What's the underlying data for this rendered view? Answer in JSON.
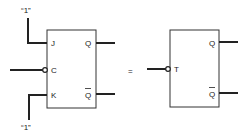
{
  "diagram": {
    "left_block": {
      "type": "JK flip-flop",
      "inputs": {
        "j": "J",
        "c": "C",
        "k": "K"
      },
      "outputs": {
        "q": "Q",
        "qbar": "Q"
      },
      "j_tie": "“1”",
      "k_tie": "“1”"
    },
    "equals": "=",
    "right_block": {
      "type": "T flip-flop",
      "inputs": {
        "t": "T"
      },
      "outputs": {
        "q": "Q",
        "qbar": "Q"
      }
    },
    "line_color": "#222222"
  }
}
